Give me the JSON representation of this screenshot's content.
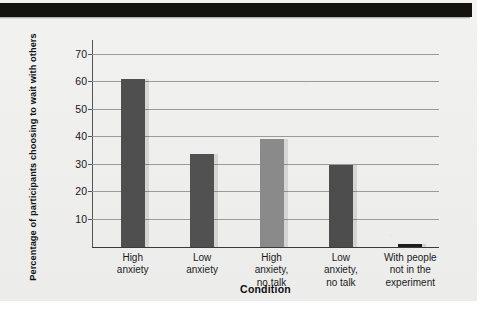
{
  "page": {
    "background_color": "#efefee",
    "banner_color": "#15120f"
  },
  "chart_data": {
    "type": "bar",
    "title": "",
    "xlabel": "Condition",
    "ylabel": "Percentage of participants choosing to wait with others",
    "categories": [
      "High anxiety",
      "Low anxiety",
      "High anxiety, no talk",
      "Low anxiety, no talk",
      "With people not in the experiment"
    ],
    "category_lines": [
      [
        "High",
        "anxiety"
      ],
      [
        "Low",
        "anxiety"
      ],
      [
        "High",
        "anxiety,",
        "no talk"
      ],
      [
        "Low",
        "anxiety,",
        "no talk"
      ],
      [
        "With people",
        "not in the",
        "experiment"
      ]
    ],
    "values": [
      61,
      33.5,
      39,
      29.5,
      1
    ],
    "bar_colors": [
      "#4f4f4f",
      "#515151",
      "#8a8a8a",
      "#4d4d4d",
      "#1d1d1d"
    ],
    "ylim": [
      0,
      75
    ],
    "yticks": [
      10,
      20,
      30,
      40,
      50,
      60,
      70
    ],
    "ytick_labels": [
      "10",
      "20",
      "30",
      "40",
      "50",
      "60",
      "70"
    ],
    "grid": true,
    "grid_color": "#9a9a9a",
    "legend": "none",
    "axis_color": "#3a3a3a"
  }
}
